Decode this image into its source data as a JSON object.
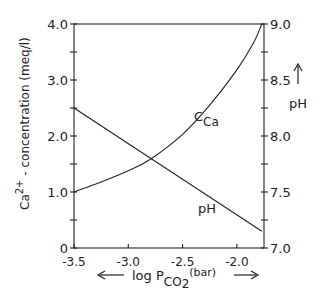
{
  "chart_data": {
    "type": "line",
    "title": "",
    "xlabel": "log P_CO2 (bar)",
    "xlabel_parts": {
      "prefix": "log P",
      "sub": "CO",
      "sub2": "2",
      "suffix": "(bar)"
    },
    "ylabel_left": "Ca2+ - concentration (meq/l)",
    "ylabel_left_parts": {
      "ca": "Ca",
      "sup": "2+",
      "rest": " - concentration (meq/l)"
    },
    "ylabel_right": "pH",
    "xlim": [
      -3.5,
      -1.75
    ],
    "ylim_left": [
      0,
      4.0
    ],
    "ylim_right": [
      7.0,
      9.0
    ],
    "x_ticks": [
      -3.5,
      -3.0,
      -2.5,
      -2.0
    ],
    "x_tick_labels": [
      "-3.5",
      "-3.0",
      "-2.5",
      "-2.0"
    ],
    "y_left_ticks": [
      0,
      0.5,
      1.0,
      1.5,
      2.0,
      2.5,
      3.0,
      3.5,
      4.0
    ],
    "y_left_tick_labels": [
      "0",
      "",
      "1.0",
      "",
      "2.0",
      "",
      "3.0",
      "",
      "4.0"
    ],
    "y_right_ticks": [
      7.0,
      7.25,
      7.5,
      7.75,
      8.0,
      8.25,
      8.5,
      8.75,
      9.0
    ],
    "y_right_tick_labels": [
      "7.0",
      "",
      "7.5",
      "",
      "8.0",
      "",
      "8.5",
      "",
      "9.0"
    ],
    "grid": false,
    "legend": "inline labels",
    "series": [
      {
        "name": "C_Ca",
        "label": "C",
        "label_sub": "Ca",
        "axis": "left",
        "x": [
          -3.5,
          -3.25,
          -3.0,
          -2.8,
          -2.5,
          -2.25,
          -2.0,
          -1.85,
          -1.77
        ],
        "values": [
          1.0,
          1.18,
          1.38,
          1.58,
          2.03,
          2.55,
          3.18,
          3.65,
          4.0
        ]
      },
      {
        "name": "pH",
        "label": "pH",
        "axis": "right",
        "x": [
          -3.5,
          -1.77
        ],
        "values": [
          8.25,
          7.15
        ]
      }
    ]
  }
}
